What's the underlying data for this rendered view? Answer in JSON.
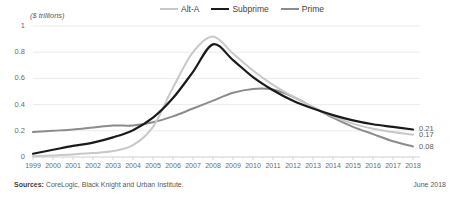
{
  "chart_data": {
    "type": "line",
    "title": "",
    "xlabel": "",
    "ylabel": "($ trillions)",
    "ylim": [
      0,
      1
    ],
    "xlim": [
      1999,
      2018
    ],
    "grid": true,
    "legend_position": "top",
    "yticks": [
      "0",
      "0.2",
      "0.4",
      "0.6",
      "0.8",
      "1"
    ],
    "ytick_values": [
      0,
      0.2,
      0.4,
      0.6,
      0.8,
      1
    ],
    "categories": [
      1999,
      2000,
      2001,
      2002,
      2003,
      2004,
      2005,
      2006,
      2007,
      2008,
      2009,
      2010,
      2011,
      2012,
      2013,
      2014,
      2015,
      2016,
      2017,
      2018
    ],
    "xtick_labels": [
      "1999",
      "2000",
      "2001",
      "2002",
      "2003",
      "2004",
      "2005",
      "2006",
      "2007",
      "2008",
      "2009",
      "2010",
      "2011",
      "2012",
      "2013",
      "2014",
      "2015",
      "2016",
      "2017",
      "2018"
    ],
    "series": [
      {
        "name": "Alt-A",
        "color": "#c8c8c8",
        "width": 2.0,
        "end_label": "0.17",
        "values": [
          0.005,
          0.012,
          0.02,
          0.03,
          0.045,
          0.09,
          0.23,
          0.53,
          0.8,
          0.92,
          0.79,
          0.66,
          0.55,
          0.46,
          0.38,
          0.31,
          0.255,
          0.215,
          0.19,
          0.17
        ]
      },
      {
        "name": "Subprime",
        "color": "#1a1a1a",
        "width": 2.2,
        "end_label": "0.21",
        "values": [
          0.025,
          0.055,
          0.085,
          0.11,
          0.15,
          0.205,
          0.3,
          0.45,
          0.65,
          0.86,
          0.74,
          0.61,
          0.51,
          0.43,
          0.37,
          0.32,
          0.28,
          0.25,
          0.23,
          0.21
        ]
      },
      {
        "name": "Prime",
        "color": "#8c8c8c",
        "width": 2.0,
        "end_label": "0.08",
        "values": [
          0.19,
          0.2,
          0.21,
          0.225,
          0.24,
          0.24,
          0.265,
          0.31,
          0.37,
          0.43,
          0.49,
          0.52,
          0.515,
          0.46,
          0.38,
          0.3,
          0.23,
          0.175,
          0.12,
          0.08
        ]
      }
    ]
  },
  "legend": {
    "items": [
      {
        "label": "Alt-A"
      },
      {
        "label": "Subprime"
      },
      {
        "label": "Prime"
      }
    ]
  },
  "footer": {
    "sources_label": "Sources:",
    "sources_text": " CoreLogic, Black Knight and Urban Institute.",
    "date": "June 2018"
  }
}
